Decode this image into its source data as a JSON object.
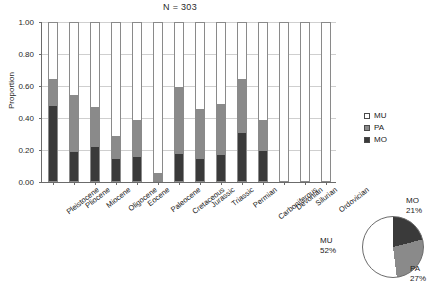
{
  "chart_data": {
    "type": "bar",
    "title": "N = 303",
    "xlabel": "",
    "ylabel": "Proportion",
    "ylim": [
      0,
      1
    ],
    "ytick_labels": [
      "0.00",
      "0.20",
      "0.40",
      "0.60",
      "0.80",
      "1.00"
    ],
    "ytick_values": [
      0,
      0.2,
      0.4,
      0.6,
      0.8,
      1.0
    ],
    "grid": true,
    "stacked": true,
    "stack_order_bottom_to_top": [
      "MO",
      "PA",
      "MU"
    ],
    "legend_position": "right",
    "categories": [
      "Pleistocene",
      "Pliocene",
      "Miocene",
      "Oligocene",
      "Eocene",
      "Paleocene",
      "Cretaceous",
      "Jurassic",
      "Triassic",
      "Permian",
      "Carboniferous",
      "Devonian",
      "Silurian",
      "Ordovician"
    ],
    "series": [
      {
        "name": "MO",
        "color": "#3a3a3a",
        "values": [
          0.47,
          0.18,
          0.21,
          0.14,
          0.15,
          0.0,
          0.17,
          0.14,
          0.16,
          0.3,
          0.19,
          0.0,
          0.0,
          0.0
        ]
      },
      {
        "name": "PA",
        "color": "#8a8a8a",
        "values": [
          0.17,
          0.36,
          0.25,
          0.14,
          0.23,
          0.05,
          0.42,
          0.31,
          0.32,
          0.34,
          0.19,
          0.0,
          0.0,
          0.0
        ]
      },
      {
        "name": "MU",
        "color": "#ffffff",
        "values": [
          0.36,
          0.46,
          0.54,
          0.72,
          0.62,
          0.95,
          0.41,
          0.55,
          0.52,
          0.36,
          0.62,
          1.0,
          1.0,
          1.0
        ]
      }
    ],
    "cumulative_tops": [
      0.64,
      0.54,
      0.46,
      0.28,
      0.38,
      0.05,
      0.59,
      0.45,
      0.48,
      0.64,
      0.38,
      0.0,
      0.0,
      0.0
    ]
  },
  "legend": {
    "items": [
      {
        "label": "MU",
        "color": "#ffffff"
      },
      {
        "label": "PA",
        "color": "#8a8a8a"
      },
      {
        "label": "MO",
        "color": "#3a3a3a"
      }
    ]
  },
  "pie_chart": {
    "type": "pie",
    "slices": [
      {
        "label": "MO",
        "percent_text": "21%",
        "value": 21,
        "color": "#3a3a3a"
      },
      {
        "label": "PA",
        "percent_text": "27%",
        "value": 27,
        "color": "#8a8a8a"
      },
      {
        "label": "MU",
        "percent_text": "52%",
        "value": 52,
        "color": "#ffffff"
      }
    ]
  }
}
